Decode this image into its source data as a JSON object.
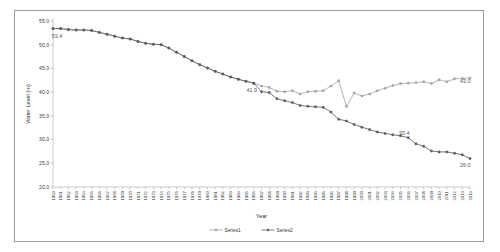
{
  "chart_data": {
    "type": "line",
    "title": "",
    "xlabel": "Year",
    "ylabel": "Water Level (m)",
    "ylim": [
      20.0,
      55.0
    ],
    "yticks": [
      "20.0",
      "25.0",
      "30.0",
      "35.0",
      "40.0",
      "45.0",
      "50.0",
      "55.0"
    ],
    "ytick_values": [
      20.0,
      25.0,
      30.0,
      35.0,
      40.0,
      45.0,
      50.0,
      55.0
    ],
    "grid": false,
    "legend_position": "bottom",
    "categories": [
      "1960",
      "1961",
      "1962",
      "1963",
      "1964",
      "1965",
      "1966",
      "1967",
      "1968",
      "1969",
      "1970",
      "1971",
      "1972",
      "1973",
      "1974",
      "1975",
      "1976",
      "1977",
      "1978",
      "1979",
      "1980",
      "1981",
      "1982",
      "1983",
      "1984",
      "1985",
      "1986",
      "1987",
      "1988",
      "1989",
      "1990",
      "1991",
      "1992",
      "1993",
      "1994",
      "1995",
      "1996",
      "1997",
      "1998",
      "1999",
      "2000",
      "2001",
      "2002",
      "2003",
      "2004",
      "2005",
      "2006",
      "2007",
      "2008",
      "2009",
      "2010",
      "2011",
      "2012",
      "2013",
      "2014"
    ],
    "series": [
      {
        "name": "Series1",
        "color": "#a6a6a6",
        "values": [
          53.4,
          53.4,
          53.2,
          53.1,
          53.1,
          53.0,
          52.6,
          52.2,
          51.8,
          51.4,
          51.2,
          50.7,
          50.3,
          50.1,
          50.0,
          49.3,
          48.4,
          47.5,
          46.6,
          45.8,
          45.1,
          44.4,
          43.8,
          43.2,
          42.7,
          42.3,
          41.9,
          41.3,
          41.0,
          40.2,
          40.1,
          40.3,
          39.6,
          40.1,
          40.2,
          40.3,
          41.3,
          42.4,
          37.0,
          39.8,
          39.2,
          39.6,
          40.3,
          40.8,
          41.4,
          41.8,
          41.9,
          42.0,
          42.2,
          41.8,
          42.6,
          42.2,
          42.8,
          42.9,
          43.0
        ]
      },
      {
        "name": "Series2",
        "color": "#5f5f5f",
        "values": [
          53.4,
          53.4,
          53.2,
          53.1,
          53.1,
          53.0,
          52.6,
          52.2,
          51.8,
          51.4,
          51.2,
          50.7,
          50.3,
          50.1,
          50.0,
          49.3,
          48.4,
          47.5,
          46.6,
          45.8,
          45.1,
          44.4,
          43.8,
          43.2,
          42.7,
          42.3,
          41.9,
          40.1,
          39.9,
          38.6,
          38.2,
          37.8,
          37.2,
          37.0,
          36.9,
          36.8,
          35.8,
          34.3,
          33.9,
          33.2,
          32.6,
          32.1,
          31.6,
          31.3,
          31.0,
          30.8,
          30.4,
          29.1,
          28.6,
          27.6,
          27.4,
          27.4,
          27.1,
          26.8,
          26.0
        ]
      }
    ],
    "annotations": [
      {
        "text": "53.4",
        "year": "1960",
        "value": 53.4
      },
      {
        "text": "41.9",
        "year": "1986",
        "value": 41.9
      },
      {
        "text": "43.0",
        "year": "2014",
        "value": 43.0
      },
      {
        "text": "30.4",
        "year": "2006",
        "value": 30.4
      },
      {
        "text": "26.0",
        "year": "2014",
        "value": 26.0
      }
    ]
  }
}
